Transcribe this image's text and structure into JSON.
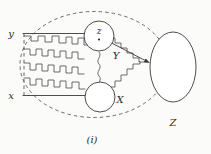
{
  "figure": {
    "caption": "(i)",
    "labels": {
      "y_left": "y",
      "x_left": "x",
      "z_small": "z",
      "X_circle": "X",
      "Y_arrow": "Y",
      "Z_ellipse": "Z"
    },
    "colors": {
      "ink": "#3a3a3a",
      "dashed": "#5a5a5a",
      "background": "#fbfbf9",
      "fill": "#ffffff"
    },
    "elements": {
      "outer_region_style": "dashed-ellipse",
      "left_connector_style": "dashed-vertical",
      "path_style": "staircase-zigzag",
      "node_z_style": "solid-circle-with-center-dot",
      "node_X_style": "solid-circle",
      "node_Z_style": "solid-ellipse",
      "Y_style": "arrow-line"
    }
  }
}
